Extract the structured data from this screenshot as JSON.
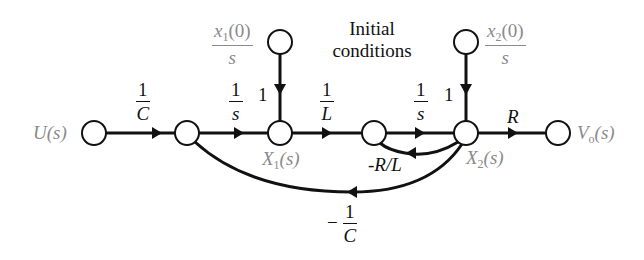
{
  "diagram": {
    "type": "signal-flow-graph",
    "title_note": {
      "line1": "Initial",
      "line2": "conditions"
    },
    "nodes": [
      {
        "id": "U",
        "label": "U(s)"
      },
      {
        "id": "n1",
        "label": ""
      },
      {
        "id": "X1",
        "label": "X1(s)",
        "label_main": "X",
        "label_sub": "1",
        "label_tail": "(s)"
      },
      {
        "id": "n3",
        "label": ""
      },
      {
        "id": "X2",
        "label": "X2(s)",
        "label_main": "X",
        "label_sub": "2",
        "label_tail": "(s)"
      },
      {
        "id": "Vo",
        "label": "Vo(s)",
        "label_main": "V",
        "label_sub": "o",
        "label_tail": "(s)"
      },
      {
        "id": "IC1",
        "label": "x1(0)/s"
      },
      {
        "id": "IC2",
        "label": "x2(0)/s"
      }
    ],
    "inputs": {
      "u": "U(s)"
    },
    "initial_conditions": {
      "ic1": {
        "num_main": "x",
        "num_sub": "1",
        "num_tail": "(0)",
        "den": "s",
        "gain": "1"
      },
      "ic2": {
        "num_main": "x",
        "num_sub": "2",
        "num_tail": "(0)",
        "den": "s",
        "gain": "1"
      }
    },
    "branches": [
      {
        "from": "U",
        "to": "n1",
        "gain": "1/C",
        "num": "1",
        "den": "C"
      },
      {
        "from": "n1",
        "to": "X1",
        "gain": "1/s",
        "num": "1",
        "den": "s"
      },
      {
        "from": "X1",
        "to": "n3",
        "gain": "1/L",
        "num": "1",
        "den": "L"
      },
      {
        "from": "n3",
        "to": "X2",
        "gain": "1/s",
        "num": "1",
        "den": "s"
      },
      {
        "from": "X2",
        "to": "Vo",
        "gain": "R"
      },
      {
        "from": "X2",
        "to": "n3",
        "gain": "-R/L"
      },
      {
        "from": "X2",
        "to": "n1",
        "gain": "-1/C",
        "sign": "−",
        "num": "1",
        "den": "C"
      },
      {
        "from": "IC1",
        "to": "X1",
        "gain": "1"
      },
      {
        "from": "IC2",
        "to": "X2",
        "gain": "1"
      }
    ]
  }
}
